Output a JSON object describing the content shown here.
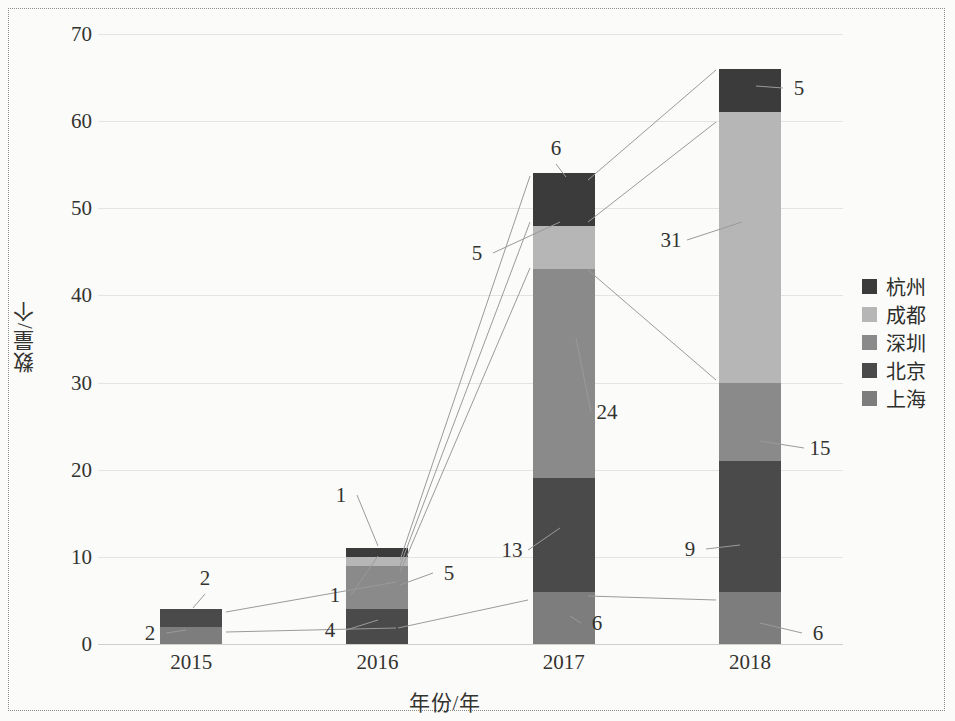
{
  "chart_data": {
    "type": "bar",
    "subtype": "stacked-column",
    "title": "",
    "xlabel": "年份/年",
    "ylabel": "数量/个",
    "categories": [
      "2015",
      "2016",
      "2017",
      "2018"
    ],
    "ylim": [
      0,
      70
    ],
    "yticks": [
      0,
      10,
      20,
      30,
      40,
      50,
      60,
      70
    ],
    "grid": true,
    "legend_position": "right",
    "stack_order_bottom_to_top": [
      "上海",
      "北京",
      "深圳",
      "成都",
      "杭州"
    ],
    "series": [
      {
        "name": "杭州",
        "color": "#3b3b3b",
        "values": [
          0,
          1,
          6,
          5
        ]
      },
      {
        "name": "成都",
        "color": "#b6b6b6",
        "values": [
          0,
          1,
          5,
          31
        ]
      },
      {
        "name": "深圳",
        "color": "#8a8a8a",
        "values": [
          0,
          5,
          24,
          9
        ]
      },
      {
        "name": "北京",
        "color": "#4a4a4a",
        "values": [
          2,
          4,
          13,
          15
        ]
      },
      {
        "name": "上海",
        "color": "#7d7d7d",
        "values": [
          2,
          0,
          6,
          6
        ]
      }
    ],
    "totals": [
      4,
      11,
      54,
      66
    ],
    "data_labels": [
      {
        "year": "2015",
        "series": "北京",
        "value": "2"
      },
      {
        "year": "2015",
        "series": "上海",
        "value": "2"
      },
      {
        "year": "2016",
        "series": "杭州",
        "value": "1"
      },
      {
        "year": "2016",
        "series": "成都",
        "value": "1"
      },
      {
        "year": "2016",
        "series": "深圳",
        "value": "5"
      },
      {
        "year": "2016",
        "series": "北京",
        "value": "4"
      },
      {
        "year": "2017",
        "series": "杭州",
        "value": "6"
      },
      {
        "year": "2017",
        "series": "成都",
        "value": "5"
      },
      {
        "year": "2017",
        "series": "深圳",
        "value": "24"
      },
      {
        "year": "2017",
        "series": "北京",
        "value": "13"
      },
      {
        "year": "2017",
        "series": "上海",
        "value": "6"
      },
      {
        "year": "2018",
        "series": "杭州",
        "value": "5"
      },
      {
        "year": "2018",
        "series": "成都",
        "value": "31"
      },
      {
        "year": "2018",
        "series": "深圳",
        "value": "9"
      },
      {
        "year": "2018",
        "series": "北京",
        "value": "15"
      },
      {
        "year": "2018",
        "series": "上海",
        "value": "6"
      }
    ]
  },
  "axis": {
    "y_title": "数量/个",
    "x_title": "年份/年",
    "y_ticks": [
      "70",
      "60",
      "50",
      "40",
      "30",
      "20",
      "10",
      "0"
    ],
    "x_ticks": [
      "2015",
      "2016",
      "2017",
      "2018"
    ]
  },
  "legend": {
    "items": [
      {
        "label": "杭州",
        "color": "#3b3b3b"
      },
      {
        "label": "成都",
        "color": "#b6b6b6"
      },
      {
        "label": "深圳",
        "color": "#8a8a8a"
      },
      {
        "label": "北京",
        "color": "#4a4a4a"
      },
      {
        "label": "上海",
        "color": "#7d7d7d"
      }
    ]
  }
}
